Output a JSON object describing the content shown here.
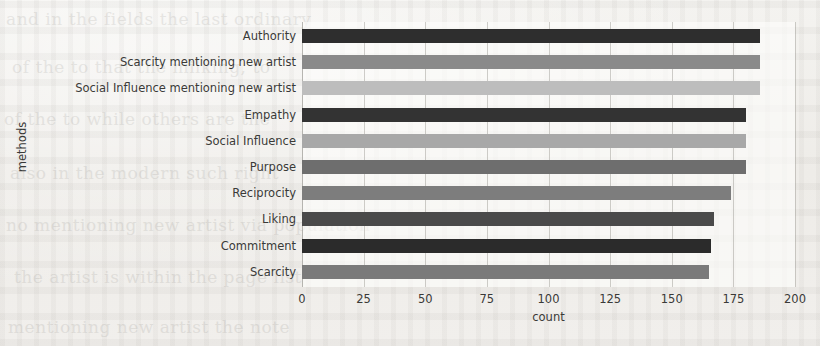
{
  "chart_data": {
    "type": "bar",
    "orientation": "horizontal",
    "title": "",
    "xlabel": "count",
    "ylabel": "methods",
    "categories": [
      "Authority",
      "Scarcity mentioning new artist",
      "Social Influence mentioning new artist",
      "Empathy",
      "Social Influence",
      "Purpose",
      "Reciprocity",
      "Liking",
      "Commitment",
      "Scarcity"
    ],
    "values": [
      186,
      186,
      186,
      180,
      180,
      180,
      174,
      167,
      166,
      165
    ],
    "bar_colors": [
      "#2e2e2e",
      "#8a8a8a",
      "#bdbdbd",
      "#333333",
      "#a8a8a8",
      "#6e6e6e",
      "#7d7d7d",
      "#4a4a4a",
      "#2b2b2b",
      "#7a7a7a"
    ],
    "xlim": [
      0,
      200
    ],
    "xticks": [
      0,
      25,
      50,
      75,
      100,
      125,
      150,
      175,
      200
    ],
    "xtick_labels": [
      "0",
      "25",
      "50",
      "75",
      "100",
      "125",
      "150",
      "175",
      "200"
    ],
    "grid": true,
    "grid_axis": "x",
    "legend": false
  },
  "background_text": {
    "lines": [
      "and in the fields the last ordinary",
      "of the to that the milking, to",
      "of the to while others are the",
      "also in the modern such right",
      "no mentioning new artist via population",
      "the artist is within the page list",
      "mentioning new artist the note"
    ]
  }
}
